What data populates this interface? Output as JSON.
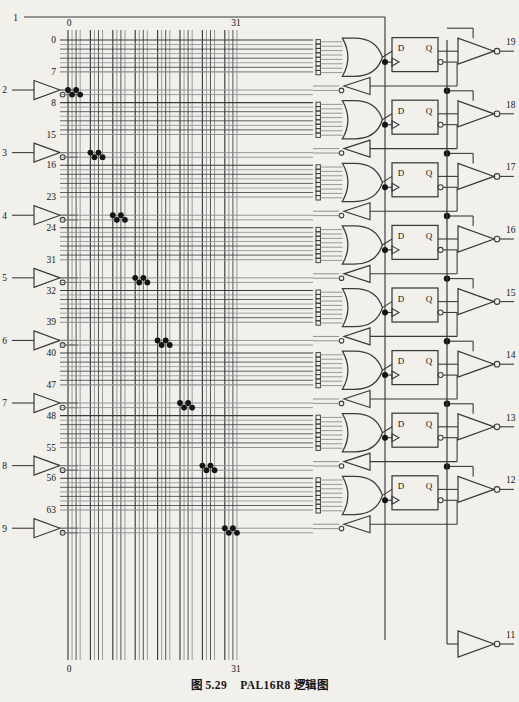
{
  "figure": {
    "caption_prefix": "图 5.29",
    "caption_title": "PAL16R8 逻辑图",
    "device": "PAL16R8",
    "type": "logic-diagram"
  },
  "array": {
    "column_label_left_top": "0",
    "column_label_right_top": "31",
    "column_label_left_bottom": "0",
    "column_label_right_bottom": "31",
    "columns": 32,
    "rows": 64,
    "row_labels": [
      "0",
      "7",
      "8",
      "15",
      "16",
      "23",
      "24",
      "31",
      "32",
      "39",
      "40",
      "47",
      "48",
      "55",
      "56",
      "63"
    ]
  },
  "input_pins": [
    {
      "pin": "1",
      "role": "clock"
    },
    {
      "pin": "2",
      "role": "input-buffer"
    },
    {
      "pin": "3",
      "role": "input-buffer"
    },
    {
      "pin": "4",
      "role": "input-buffer"
    },
    {
      "pin": "5",
      "role": "input-buffer"
    },
    {
      "pin": "6",
      "role": "input-buffer"
    },
    {
      "pin": "7",
      "role": "input-buffer"
    },
    {
      "pin": "8",
      "role": "input-buffer"
    },
    {
      "pin": "9",
      "role": "input-buffer"
    }
  ],
  "output_pins": [
    {
      "pin": "19"
    },
    {
      "pin": "18"
    },
    {
      "pin": "17"
    },
    {
      "pin": "16"
    },
    {
      "pin": "15"
    },
    {
      "pin": "14"
    },
    {
      "pin": "13"
    },
    {
      "pin": "12"
    }
  ],
  "oe_pin": {
    "pin": "11",
    "role": "output-enable"
  },
  "flipflop": {
    "d_label": "D",
    "q_label": "Q",
    "count": 8
  },
  "colors": {
    "background": "#f2f0eb",
    "line": "#3a3a3a",
    "line_light": "#8d8d8d",
    "ink": "#151515",
    "fuse": "#141414"
  },
  "chart_data": {
    "type": "diagram",
    "title": "PAL16R8 逻辑图",
    "fuse_dots": [
      {
        "group": 1,
        "points": [
          [
            0,
            0
          ],
          [
            2,
            0
          ],
          [
            1,
            1
          ],
          [
            3,
            1
          ]
        ]
      },
      {
        "group": 2,
        "points": [
          [
            4,
            0
          ],
          [
            6,
            0
          ],
          [
            5,
            1
          ],
          [
            7,
            1
          ]
        ]
      },
      {
        "group": 3,
        "points": [
          [
            8,
            0
          ],
          [
            10,
            0
          ],
          [
            9,
            1
          ],
          [
            11,
            1
          ]
        ]
      },
      {
        "group": 4,
        "points": [
          [
            12,
            0
          ],
          [
            14,
            0
          ],
          [
            13,
            1
          ],
          [
            15,
            1
          ]
        ]
      },
      {
        "group": 5,
        "points": [
          [
            16,
            0
          ],
          [
            18,
            0
          ],
          [
            17,
            1
          ],
          [
            19,
            1
          ]
        ]
      },
      {
        "group": 6,
        "points": [
          [
            20,
            0
          ],
          [
            22,
            0
          ],
          [
            21,
            1
          ],
          [
            23,
            1
          ]
        ]
      },
      {
        "group": 7,
        "points": [
          [
            24,
            0
          ],
          [
            26,
            0
          ],
          [
            25,
            1
          ],
          [
            27,
            1
          ]
        ]
      },
      {
        "group": 8,
        "points": [
          [
            28,
            0
          ],
          [
            30,
            0
          ],
          [
            29,
            1
          ],
          [
            31,
            1
          ]
        ]
      }
    ]
  }
}
